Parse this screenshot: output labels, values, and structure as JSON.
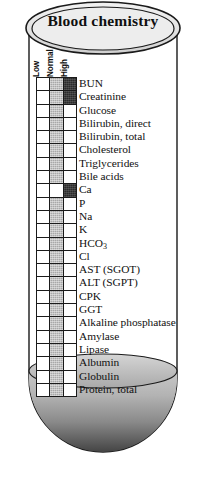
{
  "figure": {
    "title": "Blood chemistry",
    "container_name": "test-tube",
    "fill_color": "#2a2a2a",
    "glass_color": "#ffffff",
    "outline_color": "#1a1a1a"
  },
  "legend": {
    "columns": [
      "Low",
      "Normal",
      "High"
    ],
    "state_colors": {
      "empty": "#ffffff",
      "gray": "#a8a8a8",
      "dark": "#2b2b2b"
    }
  },
  "chart_data": {
    "type": "heatmap",
    "title": "Blood chemistry",
    "xlabel": "",
    "ylabel": "",
    "categories": [
      "Low",
      "Normal",
      "High"
    ],
    "legend_position": "top-rotated",
    "grid": true,
    "rows": [
      {
        "label": "BUN",
        "cells": [
          "empty",
          "gray",
          "dark"
        ]
      },
      {
        "label": "Creatinine",
        "cells": [
          "empty",
          "gray",
          "dark"
        ]
      },
      {
        "label": "Glucose",
        "cells": [
          "empty",
          "gray",
          "empty"
        ]
      },
      {
        "label": "Bilirubin, direct",
        "cells": [
          "empty",
          "gray",
          "empty"
        ]
      },
      {
        "label": "Bilirubin, total",
        "cells": [
          "empty",
          "gray",
          "empty"
        ]
      },
      {
        "label": "Cholesterol",
        "cells": [
          "empty",
          "gray",
          "empty"
        ]
      },
      {
        "label": "Triglycerides",
        "cells": [
          "empty",
          "gray",
          "empty"
        ]
      },
      {
        "label": "Bile acids",
        "cells": [
          "empty",
          "gray",
          "empty"
        ]
      },
      {
        "label": "Ca",
        "cells": [
          "empty",
          "empty",
          "dark"
        ]
      },
      {
        "label": "P",
        "cells": [
          "empty",
          "gray",
          "empty"
        ]
      },
      {
        "label": "Na",
        "cells": [
          "empty",
          "gray",
          "empty"
        ]
      },
      {
        "label": "K",
        "cells": [
          "empty",
          "gray",
          "empty"
        ]
      },
      {
        "label": "HCO3",
        "cells": [
          "empty",
          "gray",
          "empty"
        ]
      },
      {
        "label": "Cl",
        "cells": [
          "empty",
          "gray",
          "empty"
        ]
      },
      {
        "label": "AST (SGOT)",
        "cells": [
          "empty",
          "gray",
          "empty"
        ]
      },
      {
        "label": "ALT (SGPT)",
        "cells": [
          "empty",
          "gray",
          "empty"
        ]
      },
      {
        "label": "CPK",
        "cells": [
          "empty",
          "gray",
          "empty"
        ]
      },
      {
        "label": "GGT",
        "cells": [
          "empty",
          "gray",
          "empty"
        ]
      },
      {
        "label": "Alkaline phosphatase",
        "cells": [
          "empty",
          "gray",
          "empty"
        ]
      },
      {
        "label": "Amylase",
        "cells": [
          "empty",
          "gray",
          "empty"
        ]
      },
      {
        "label": "Lipase",
        "cells": [
          "empty",
          "gray",
          "empty"
        ]
      },
      {
        "label": "Albumin",
        "cells": [
          "empty",
          "gray",
          "empty"
        ]
      },
      {
        "label": "Globulin",
        "cells": [
          "empty",
          "gray",
          "empty"
        ]
      },
      {
        "label": "Protein, total",
        "cells": [
          "empty",
          "gray",
          "empty"
        ]
      }
    ]
  }
}
